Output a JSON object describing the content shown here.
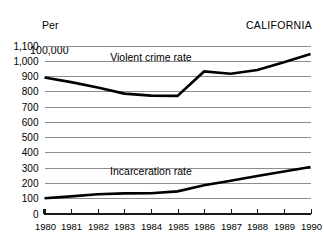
{
  "figure": {
    "unit_label_line1": "Per",
    "unit_label_line2": "100,000",
    "title": "CALIFORNIA"
  },
  "chart_data": {
    "type": "line",
    "title": "CALIFORNIA",
    "xlabel": "",
    "ylabel": "Per 100,000",
    "xlim": [
      1980,
      1990
    ],
    "ylim": [
      0,
      1100
    ],
    "ytick_step": 100,
    "grid": true,
    "legend_position": "inline-annotation",
    "categories": [
      1980,
      1981,
      1982,
      1983,
      1984,
      1985,
      1986,
      1987,
      1988,
      1989,
      1990
    ],
    "xtick_labels": [
      "1980",
      "1981",
      "1982",
      "1983",
      "1984",
      "1985",
      "1986",
      "1987",
      "1988",
      "1989",
      "1990"
    ],
    "ytick_labels": [
      "0",
      "100",
      "200",
      "300",
      "400",
      "500",
      "600",
      "700",
      "800",
      "900",
      "1,000",
      "1,100"
    ],
    "series": [
      {
        "name": "Violent crime rate",
        "color": "#000000",
        "values": [
          890,
          860,
          825,
          785,
          772,
          770,
          930,
          915,
          940,
          990,
          1045
        ]
      },
      {
        "name": "Incarceration rate",
        "color": "#000000",
        "values": [
          100,
          112,
          126,
          132,
          133,
          145,
          185,
          215,
          245,
          275,
          305
        ]
      }
    ],
    "annotations": [
      {
        "text": "Violent crime rate",
        "x": 1984,
        "y": 1000
      },
      {
        "text": "Incarceration rate",
        "x": 1984,
        "y": 255
      }
    ]
  }
}
